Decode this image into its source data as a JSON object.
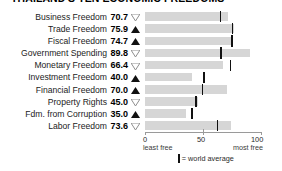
{
  "title": "THAILAND'S TEN ECONOMIC FREEDOMS",
  "axis": {
    "min_label": "0",
    "mid_label": "50",
    "max_label": "100",
    "min_sub": "least free",
    "max_sub": "most free"
  },
  "legend": {
    "text": "= world average",
    "marker_name": "world-average-tick"
  },
  "chart_data": {
    "type": "bar",
    "title": "THAILAND'S TEN ECONOMIC FREEDOMS",
    "xlabel": "",
    "ylabel": "",
    "xlim": [
      0,
      100
    ],
    "grid": false,
    "orientation": "horizontal",
    "legend_position": "bottom",
    "axis_ticks": [
      0,
      50,
      100
    ],
    "axis_tick_labels": [
      "0",
      "50",
      "100"
    ],
    "axis_endpoint_notes": [
      "least free",
      "most free"
    ],
    "categories": [
      "Business Freedom",
      "Trade Freedom",
      "Fiscal Freedom",
      "Government Spending",
      "Monetary Freedom",
      "Investment Freedom",
      "Financial Freedom",
      "Property Rights",
      "Fdm. from Corruption",
      "Labor Freedom"
    ],
    "values": [
      70.7,
      75.9,
      74.7,
      89.8,
      66.4,
      40.0,
      70.0,
      45.0,
      35.0,
      73.6
    ],
    "value_labels": [
      "70.7",
      "75.9",
      "74.7",
      "89.8",
      "66.4",
      "40.0",
      "70.0",
      "45.0",
      "35.0",
      "73.6"
    ],
    "world_average": [
      64.6,
      74.8,
      74.4,
      64.8,
      73.2,
      50.2,
      49.0,
      43.8,
      40.4,
      62.1
    ],
    "trend": [
      "down",
      "up",
      "up",
      "down",
      "down",
      "up",
      "up",
      "down",
      "up",
      "down"
    ],
    "series": [
      {
        "name": "Thailand score",
        "values": [
          70.7,
          75.9,
          74.7,
          89.8,
          66.4,
          40.0,
          70.0,
          45.0,
          35.0,
          73.6
        ]
      },
      {
        "name": "world average",
        "values": [
          64.6,
          74.8,
          74.4,
          64.8,
          73.2,
          50.2,
          49.0,
          43.8,
          40.4,
          62.1
        ]
      }
    ]
  }
}
